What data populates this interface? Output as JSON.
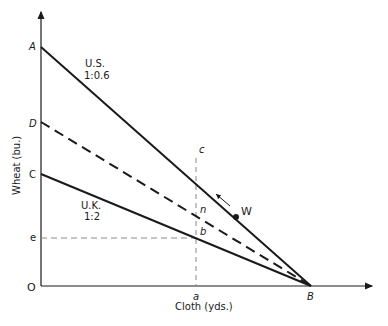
{
  "axes": {
    "x_label": "Cloth (yds.)",
    "y_label": "Wheat (bu.)",
    "origin_label": "O"
  },
  "points": {
    "A": "A",
    "D": "D",
    "C": "C",
    "e": "e",
    "a": "a",
    "B": "B",
    "c": "c",
    "n": "n",
    "b": "b",
    "W": "W"
  },
  "lines": {
    "us": {
      "name": "U.S.",
      "ratio": "1:0.6",
      "from": "A",
      "to": "B",
      "style": "solid"
    },
    "uk": {
      "name": "U.K.",
      "ratio": "1:2",
      "from": "C",
      "to": "B",
      "style": "solid"
    },
    "terms_of_trade": {
      "from": "D",
      "to": "B",
      "style": "dashed"
    }
  },
  "colors": {
    "line": "#1a1a1a",
    "guide": "#888888",
    "background": "#ffffff"
  }
}
